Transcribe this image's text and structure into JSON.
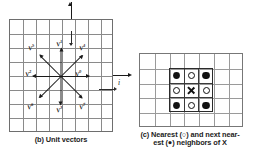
{
  "figure": {
    "panels": [
      {
        "id": "b",
        "caption": "(b) Unit vectors",
        "grid": {
          "cols": 8,
          "rows": 8
        },
        "axes": [
          {
            "name": "j",
            "label": "j",
            "direction": "up"
          },
          {
            "name": "i",
            "label": "i",
            "direction": "right"
          }
        ],
        "vectors": [
          {
            "label": "V",
            "index": "0",
            "angle_deg": 0,
            "direction": "east",
            "label_x": 66,
            "label_y": 50
          },
          {
            "label": "V",
            "index": "1",
            "angle_deg": 90,
            "direction": "north",
            "label_x": 47,
            "label_y": 20
          },
          {
            "label": "V",
            "index": "2",
            "angle_deg": 180,
            "direction": "west",
            "label_x": 16,
            "label_y": 50
          },
          {
            "label": "V",
            "index": "3",
            "angle_deg": 270,
            "direction": "south",
            "label_x": 47,
            "label_y": 86
          },
          {
            "label": "V",
            "index": "4",
            "angle_deg": 45,
            "direction": "northeast",
            "label_x": 70,
            "label_y": 24
          },
          {
            "label": "V",
            "index": "5",
            "angle_deg": 135,
            "direction": "northwest",
            "label_x": 19,
            "label_y": 24
          },
          {
            "label": "V",
            "index": "6",
            "angle_deg": 225,
            "direction": "southwest",
            "label_x": 18,
            "label_y": 83
          },
          {
            "label": "V",
            "index": "7",
            "angle_deg": 315,
            "direction": "southeast",
            "label_x": 70,
            "label_y": 83
          }
        ]
      },
      {
        "id": "c",
        "caption_line1": "(c) Nearest (○) and next near-",
        "caption_line2": "est (●) neighbors of X",
        "grid": {
          "cols": 7,
          "rows": 5
        },
        "neighborhood": {
          "center_symbol": "X",
          "nearest_symbol": "○",
          "next_nearest_symbol": "●",
          "cells": [
            [
              "next-nearest",
              "nearest",
              "next-nearest"
            ],
            [
              "nearest",
              "center",
              "nearest"
            ],
            [
              "next-nearest",
              "nearest",
              "next-nearest"
            ]
          ]
        }
      }
    ]
  },
  "colors": {
    "ink": "#1a1a1a",
    "grid_line": "#8a8a8a",
    "box_border": "#2b2b2b",
    "background": "#ffffff"
  }
}
